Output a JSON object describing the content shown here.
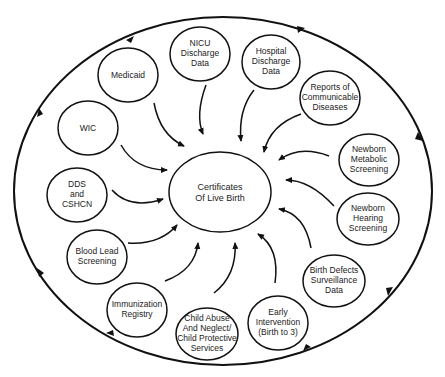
{
  "diagram": {
    "type": "hub-and-spoke",
    "center": {
      "id": "certificates",
      "lines": [
        "Certificates",
        "Of Live Birth"
      ]
    },
    "nodes": [
      {
        "id": "nicu",
        "lines": [
          "NICU",
          "Discharge",
          "Data"
        ]
      },
      {
        "id": "hospital",
        "lines": [
          "Hospital",
          "Discharge",
          "Data"
        ]
      },
      {
        "id": "reports",
        "lines": [
          "Reports of",
          "Communicable",
          "Diseases"
        ]
      },
      {
        "id": "metabolic",
        "lines": [
          "Newborn",
          "Metabolic",
          "Screening"
        ]
      },
      {
        "id": "hearing",
        "lines": [
          "Newborn",
          "Hearing",
          "Screening"
        ]
      },
      {
        "id": "birth-defects",
        "lines": [
          "Birth Defects",
          "Surveillance",
          "Data"
        ]
      },
      {
        "id": "early-intervention",
        "lines": [
          "Early",
          "Intervention",
          "(Birth to 3)"
        ]
      },
      {
        "id": "child-abuse",
        "lines": [
          "Child Abuse",
          "And Neglect/",
          "Child Protective",
          "Services"
        ]
      },
      {
        "id": "immunization",
        "lines": [
          "Immunization",
          "Registry"
        ]
      },
      {
        "id": "blood-lead",
        "lines": [
          "Blood Lead",
          "Screening"
        ]
      },
      {
        "id": "dds",
        "lines": [
          "DDS",
          "and",
          "CSHCN"
        ]
      },
      {
        "id": "wic",
        "lines": [
          "WIC"
        ]
      },
      {
        "id": "medicaid",
        "lines": [
          "Medicaid"
        ]
      }
    ],
    "edges": "each outer node -> center (curved arrows)",
    "outer_cycle": "clockwise arrows on enclosing ellipse",
    "colors": {
      "stroke": "#111111",
      "background": "#ffffff",
      "text": "#222222"
    }
  }
}
